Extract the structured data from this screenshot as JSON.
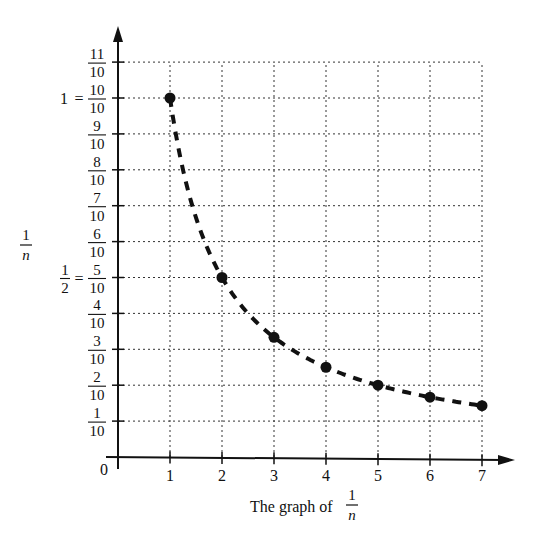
{
  "chart_data": {
    "type": "scatter",
    "caption": {
      "text": "The graph of",
      "fraction": {
        "num": "1",
        "den": "n"
      }
    },
    "xlabel": "",
    "ylabel": {
      "num": "1",
      "den": "n"
    },
    "x": [
      1,
      2,
      3,
      4,
      5,
      6,
      7
    ],
    "values": [
      1.0,
      0.5,
      0.3333,
      0.25,
      0.2,
      0.1667,
      0.1429
    ],
    "series": [
      {
        "name": "1/n",
        "marker": "filled-circle",
        "connector": "dashed-curve",
        "points": [
          [
            1,
            1.0
          ],
          [
            2,
            0.5
          ],
          [
            3,
            0.3333
          ],
          [
            4,
            0.25
          ],
          [
            5,
            0.2
          ],
          [
            6,
            0.1667
          ],
          [
            7,
            0.1429
          ]
        ]
      }
    ],
    "xlim": [
      0,
      7
    ],
    "ylim": [
      0,
      1.1
    ],
    "x_ticks": [
      "1",
      "2",
      "3",
      "4",
      "5",
      "6",
      "7"
    ],
    "y_ticks": [
      {
        "value": 0.1,
        "num": "1",
        "den": "10",
        "prefix": ""
      },
      {
        "value": 0.2,
        "num": "2",
        "den": "10",
        "prefix": ""
      },
      {
        "value": 0.3,
        "num": "3",
        "den": "10",
        "prefix": ""
      },
      {
        "value": 0.4,
        "num": "4",
        "den": "10",
        "prefix": ""
      },
      {
        "value": 0.5,
        "num": "5",
        "den": "10",
        "prefix": "1/2 ="
      },
      {
        "value": 0.6,
        "num": "6",
        "den": "10",
        "prefix": ""
      },
      {
        "value": 0.7,
        "num": "7",
        "den": "10",
        "prefix": ""
      },
      {
        "value": 0.8,
        "num": "8",
        "den": "10",
        "prefix": ""
      },
      {
        "value": 0.9,
        "num": "9",
        "den": "10",
        "prefix": ""
      },
      {
        "value": 1.0,
        "num": "10",
        "den": "10",
        "prefix": "1 ="
      },
      {
        "value": 1.1,
        "num": "11",
        "den": "10",
        "prefix": ""
      }
    ],
    "origin_label": "0",
    "grid": "dotted",
    "legend": "none"
  },
  "colors": {
    "ink": "#111111",
    "background": "#ffffff",
    "grid": "#333333"
  }
}
